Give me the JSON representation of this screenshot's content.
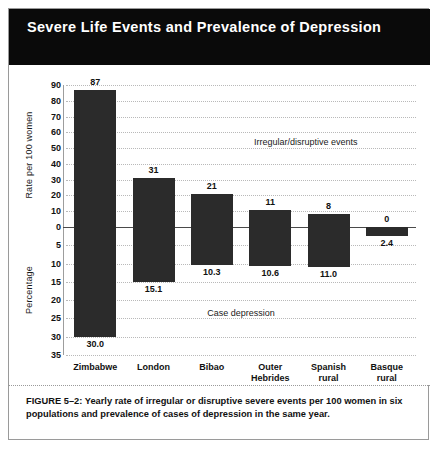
{
  "figure": {
    "title": "Severe Life Events and Prevalence of Depression",
    "caption": "FIGURE 5–2: Yearly rate of irregular or disruptive severe events per 100 women in six populations and prevalence of cases of depression in the same year.",
    "colors": {
      "title_bar_background": "#0a0a0a",
      "title_text": "#ffffff",
      "bar_fill": "#2b2b2b",
      "grid": "#b9b9b9",
      "axis": "#9d9d9d",
      "zero_line": "#4a4a4a",
      "page_background": "#ffffff",
      "frame_border": "#9a9a9a"
    }
  },
  "chart_data": {
    "type": "bar",
    "title": "Severe Life Events and Prevalence of Depression",
    "xlabel": "",
    "categories": [
      "Zimbabwe",
      "London",
      "Bibao",
      "Outer Hebrides",
      "Spanish rural",
      "Basque rural"
    ],
    "category_lines": [
      [
        "Zimbabwe"
      ],
      [
        "London"
      ],
      [
        "Bibao"
      ],
      [
        "Outer",
        "Hebrides"
      ],
      [
        "Spanish",
        "rural"
      ],
      [
        "Basque",
        "rural"
      ]
    ],
    "grid": true,
    "legend_position": "inline-annotations",
    "annotations": [
      "Irregular/disruptive events",
      "Case depression"
    ],
    "series": [
      {
        "name": "Irregular/disruptive events",
        "direction": "up",
        "ylabel": "Rate per 100 women",
        "ylim": [
          0,
          90
        ],
        "yticks": [
          90,
          80,
          70,
          60,
          50,
          40,
          30,
          20,
          10,
          0
        ],
        "values": [
          87,
          31,
          21,
          11,
          8,
          0
        ],
        "value_labels": [
          "87",
          "31",
          "21",
          "11",
          "8",
          "0"
        ]
      },
      {
        "name": "Case depression",
        "direction": "down",
        "ylabel": "Percentage",
        "ylim": [
          0,
          35
        ],
        "yticks": [
          0,
          5,
          10,
          15,
          20,
          25,
          30,
          35
        ],
        "values": [
          30.0,
          15.1,
          10.3,
          10.6,
          11.0,
          2.4
        ],
        "value_labels": [
          "30.0",
          "15.1",
          "10.3",
          "10.6",
          "11.0",
          "2.4"
        ]
      }
    ]
  }
}
